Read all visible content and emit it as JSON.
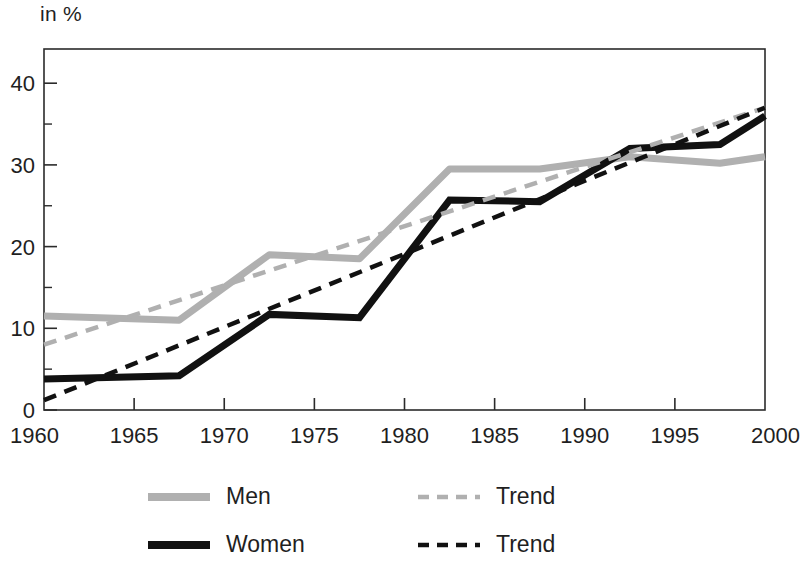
{
  "chart_data": {
    "type": "line",
    "title": "",
    "subtitle": "",
    "xlabel": "",
    "ylabel": "in %",
    "unit_label": "in %",
    "xlim": [
      1960,
      2000
    ],
    "ylim": [
      0,
      44
    ],
    "grid": false,
    "legend_position": "bottom",
    "x_ticks": [
      1960,
      1965,
      1970,
      1975,
      1980,
      1985,
      1990,
      1995,
      2000
    ],
    "x_tick_labels": [
      "1960",
      "1965",
      "1970",
      "1975",
      "1980",
      "1985",
      "1990",
      "1995",
      "2000"
    ],
    "y_ticks": [
      0,
      10,
      20,
      30,
      40
    ],
    "y_tick_labels": [
      "0",
      "10",
      "20",
      "30",
      "40"
    ],
    "y_minor_ticks": [
      5,
      15,
      25,
      35
    ],
    "series": [
      {
        "name": "Men",
        "style": "solid",
        "color": "#b0b0b0",
        "x": [
          1960,
          1967.5,
          1972.5,
          1977.5,
          1982.5,
          1987.5,
          1992.5,
          1997.5,
          2000
        ],
        "values": [
          11.5,
          11.0,
          19.0,
          18.5,
          29.5,
          29.5,
          31.0,
          30.2,
          31.0
        ]
      },
      {
        "name": "Women",
        "style": "solid",
        "color": "#111111",
        "x": [
          1960,
          1967.5,
          1972.5,
          1977.5,
          1982.5,
          1987.5,
          1992.5,
          1997.5,
          2000
        ],
        "values": [
          3.8,
          4.2,
          11.7,
          11.3,
          25.7,
          25.5,
          32.0,
          32.5,
          36.0
        ]
      },
      {
        "name": "Trend",
        "style": "dashed",
        "color": "#b0b0b0",
        "x": [
          1960,
          2000
        ],
        "values": [
          8.0,
          37.0
        ]
      },
      {
        "name": "Trend",
        "style": "dashed",
        "color": "#111111",
        "x": [
          1960,
          2000
        ],
        "values": [
          1.2,
          37.0
        ]
      }
    ]
  },
  "legend": {
    "entries": [
      {
        "label": "Men",
        "color": "#b0b0b0",
        "style": "solid"
      },
      {
        "label": "Trend",
        "color": "#b0b0b0",
        "style": "dashed"
      },
      {
        "label": "Women",
        "color": "#111111",
        "style": "solid"
      },
      {
        "label": "Trend",
        "color": "#111111",
        "style": "dashed"
      }
    ]
  },
  "colors": {
    "men": "#b0b0b0",
    "women": "#111111",
    "axis": "#2b2b2b",
    "background": "#ffffff"
  }
}
